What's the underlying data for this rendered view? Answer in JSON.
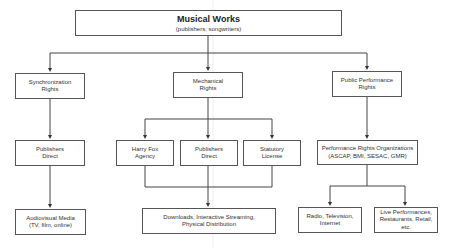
{
  "root": {
    "title": "Musical Works",
    "subtitle": "(publishers; songwriters)"
  },
  "level1": [
    {
      "id": "sync",
      "lines": [
        "Synchronization",
        "Rights"
      ]
    },
    {
      "id": "mech",
      "lines": [
        "Mechanical",
        "Rights"
      ]
    },
    {
      "id": "public",
      "lines": [
        "Public Performance",
        "Rights"
      ]
    }
  ],
  "level2": [
    {
      "id": "pub-direct-sync",
      "lines": [
        "Publishers",
        "Direct"
      ]
    },
    {
      "id": "harry-fox",
      "lines": [
        "Harry Fox",
        "Agency"
      ]
    },
    {
      "id": "pub-direct-mech",
      "lines": [
        "Publishers",
        "Direct"
      ]
    },
    {
      "id": "statutory",
      "lines": [
        "Statutory",
        "License"
      ]
    },
    {
      "id": "pro",
      "lines": [
        "Performance Rights Organizations",
        "(ASCAP, BMI, SESAC, GMR)"
      ]
    }
  ],
  "level3": [
    {
      "id": "audiovisual",
      "lines": [
        "Audiovisual Media",
        "(TV, film, online)"
      ]
    },
    {
      "id": "downloads",
      "lines": [
        "Downloads, Interactive Streaming,",
        "Physical Distribution"
      ]
    },
    {
      "id": "radio",
      "lines": [
        "Radio, Television,",
        "Internet"
      ]
    },
    {
      "id": "live",
      "lines": [
        "Live Performances,",
        "Restaurants, Retail,",
        "etc."
      ]
    }
  ]
}
